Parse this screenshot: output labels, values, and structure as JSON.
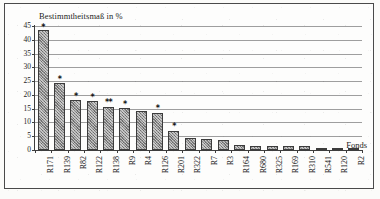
{
  "chart_data": {
    "type": "bar",
    "title": "Bestimmtheitsmaß in %",
    "xlabel": "Fonds",
    "ylabel": "",
    "ylim": [
      0,
      45
    ],
    "yticks": [
      0,
      5,
      10,
      15,
      20,
      25,
      30,
      35,
      40,
      45
    ],
    "grid": true,
    "legend": "none",
    "categories": [
      "R171",
      "R139",
      "R82",
      "R122",
      "R138",
      "R9",
      "R4",
      "R126",
      "R201",
      "R322",
      "R7",
      "R3",
      "R164",
      "R680",
      "R325",
      "R169",
      "R310",
      "R541",
      "R120",
      "R2"
    ],
    "values": [
      43.5,
      24.5,
      18.0,
      17.8,
      15.6,
      15.1,
      14.1,
      13.5,
      6.8,
      4.2,
      3.9,
      3.8,
      2.0,
      1.6,
      1.4,
      1.4,
      1.3,
      0.8,
      0.5,
      0.3
    ],
    "annotations": [
      {
        "category": "R171",
        "marker": "*",
        "at": 44.6
      },
      {
        "category": "R139",
        "marker": "*",
        "at": 25.6
      },
      {
        "category": "R82",
        "marker": "*",
        "at": 19.6
      },
      {
        "category": "R122",
        "marker": "*",
        "at": 19.4
      },
      {
        "category": "R138",
        "marker": "**",
        "at": 17.3
      },
      {
        "category": "R9",
        "marker": "*",
        "at": 16.8
      },
      {
        "category": "R126",
        "marker": "*",
        "at": 15.2
      },
      {
        "category": "R201",
        "marker": "*",
        "at": 8.6
      }
    ]
  },
  "style": {
    "bar_fill": "#8c8c8c",
    "bar_border": "#3c3c3c",
    "gridline_color": "#9e9e9e",
    "axis_color": "#3d3d3d",
    "text_color": "#1d1d1d",
    "page_background": "#fbfbf9",
    "frame_border": "#4a4a4a"
  }
}
